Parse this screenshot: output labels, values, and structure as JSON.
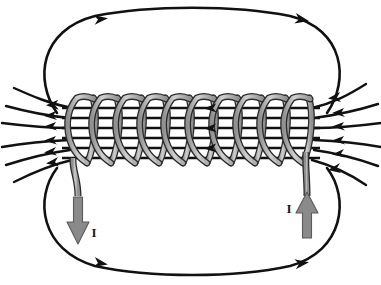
{
  "figure": {
    "name": "solenoid-magnetic-field-diagram",
    "background_color": "#ffffff"
  },
  "colors": {
    "field_line": "#111111",
    "wire_fill": "#9c9c9c",
    "wire_fill_light": "#c9c9c9",
    "wire_outline": "#2b2b2b",
    "arrow_fill": "#8a8a8a",
    "arrow_outline": "#4a4a4a",
    "label_text": "#1a1a1a"
  },
  "coil": {
    "name": "solenoid-coil",
    "turns": 10,
    "first_turn_center_x": 80,
    "turn_spacing": 24,
    "top_y": 98,
    "bottom_y": 163,
    "half_width": 13,
    "tube_width": 4.2,
    "lean": 7
  },
  "leads": {
    "left": {
      "name": "left-lead-wire",
      "label": "I",
      "label_x": 92,
      "label_y": 233,
      "direction": "down",
      "arrow_x": 78,
      "arrow_tail_y": 196,
      "arrow_tip_y": 243
    },
    "right": {
      "name": "right-lead-wire",
      "label": "I",
      "label_x": 288,
      "label_y": 210,
      "direction": "up",
      "arrow_x": 307,
      "arrow_tail_y": 237,
      "arrow_tip_y": 196
    }
  },
  "field_lines": {
    "interior_count": 6,
    "left_fan_count": 6,
    "right_fan_count": 6,
    "interior_direction": "leftward",
    "exterior_loop_direction": "rightward",
    "outer_loops": [
      {
        "name": "upper-outer-field-loop",
        "position": "above-solenoid"
      },
      {
        "name": "lower-outer-field-loop",
        "position": "below-solenoid"
      }
    ],
    "interior_y_values": [
      108,
      118,
      128,
      138,
      148,
      158
    ]
  },
  "labels": {
    "current_symbol": "I"
  }
}
